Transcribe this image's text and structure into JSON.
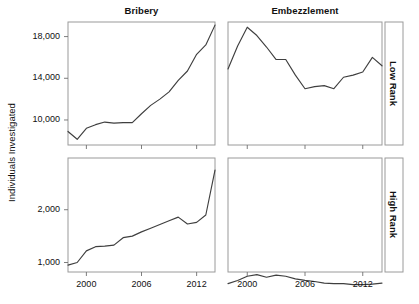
{
  "figure": {
    "ylabel": "Individuals Investigated",
    "column_titles": [
      "Bribery",
      "Embezzlement"
    ],
    "row_titles": [
      "Low Rank",
      "High Rank"
    ],
    "line_color": "#3f3f3f",
    "frame_color": "#9a9a9a",
    "grid_color": "#ededed"
  },
  "chart_data": {
    "type": "line",
    "title": "",
    "layout": "2x2 small multiples; columns = crime type, rows = official rank",
    "xlabel": "",
    "ylabel": "Individuals Investigated",
    "grid": true,
    "legend": "none",
    "xlim": [
      1998,
      2014
    ],
    "xticks": [
      2000,
      2006,
      2012
    ],
    "xticklabels": [
      "2000",
      "2006",
      "2012"
    ],
    "panels": [
      {
        "column": "Bribery",
        "row": "Low Rank",
        "ylim": [
          7600,
          19400
        ],
        "yticks": [
          10000,
          14000,
          18000
        ],
        "yticklabels": [
          "10,000",
          "14,000",
          "18,000"
        ],
        "x": [
          1998,
          1999,
          2000,
          2001,
          2002,
          2003,
          2004,
          2005,
          2006,
          2007,
          2008,
          2009,
          2010,
          2011,
          2012,
          2013,
          2014
        ],
        "values": [
          8900,
          8150,
          9200,
          9550,
          9800,
          9700,
          9750,
          9750,
          10600,
          11400,
          12000,
          12700,
          13800,
          14700,
          16300,
          17200,
          19100
        ]
      },
      {
        "column": "Embezzlement",
        "row": "Low Rank",
        "ylim": [
          7600,
          19400
        ],
        "yticks": [
          10000,
          14000,
          18000
        ],
        "yticklabels": [
          "10,000",
          "14,000",
          "18,000"
        ],
        "x": [
          1998,
          1999,
          2000,
          2001,
          2002,
          2003,
          2004,
          2005,
          2006,
          2007,
          2008,
          2009,
          2010,
          2011,
          2012,
          2013,
          2014
        ],
        "values": [
          14900,
          17100,
          18900,
          18100,
          17000,
          15800,
          15800,
          14300,
          13000,
          13200,
          13300,
          13000,
          14100,
          14300,
          14600,
          16000,
          15200
        ]
      },
      {
        "column": "Bribery",
        "row": "High Rank",
        "ylim": [
          820,
          2980
        ],
        "yticks": [
          1000,
          2000
        ],
        "yticklabels": [
          "1,000",
          "2,000"
        ],
        "x": [
          1998,
          1999,
          2000,
          2001,
          2002,
          2003,
          2004,
          2005,
          2006,
          2007,
          2008,
          2009,
          2010,
          2011,
          2012,
          2013,
          2014
        ],
        "values": [
          950,
          1000,
          1220,
          1300,
          1310,
          1330,
          1470,
          1500,
          1580,
          1650,
          1720,
          1790,
          1860,
          1730,
          1760,
          1900,
          2750
        ]
      },
      {
        "column": "Embezzlement",
        "row": "High Rank",
        "ylim": [
          820,
          2980
        ],
        "yticks": [
          1000,
          2000
        ],
        "yticklabels": [
          "1,000",
          "2,000"
        ],
        "x": [
          1998,
          1999,
          2000,
          2001,
          2002,
          2003,
          2004,
          2005,
          2006,
          2007,
          2008,
          2009,
          2010,
          2011,
          2012,
          2013,
          2014
        ],
        "values": [
          600,
          660,
          740,
          770,
          720,
          760,
          740,
          690,
          660,
          640,
          610,
          600,
          600,
          580,
          580,
          590,
          610
        ]
      }
    ]
  }
}
